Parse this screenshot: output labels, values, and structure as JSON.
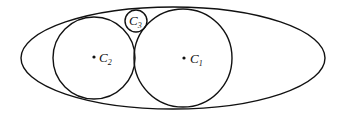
{
  "diagram": {
    "type": "geometry",
    "stroke_color": "#111111",
    "background": "#ffffff",
    "ellipse": {
      "cx": 173,
      "cy": 58,
      "rx": 152,
      "ry": 51
    },
    "circles": [
      {
        "id": "C1",
        "label": "C",
        "subscript": "1",
        "cx": 183,
        "cy": 58,
        "r": 49,
        "show_center": true
      },
      {
        "id": "C2",
        "label": "C",
        "subscript": "2",
        "cx": 94,
        "cy": 58,
        "r": 41,
        "show_center": true
      },
      {
        "id": "C3",
        "label": "C",
        "subscript": "3",
        "cx": 136,
        "cy": 21,
        "r": 11,
        "show_center": false
      }
    ]
  }
}
